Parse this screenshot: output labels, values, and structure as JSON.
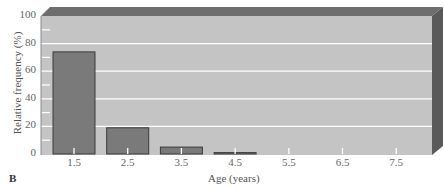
{
  "chart_data": {
    "type": "bar",
    "title": "",
    "panel_label": "B",
    "xlabel": "Age (years)",
    "ylabel": "Relative frequency (%)",
    "categories": [
      "1.5",
      "2.5",
      "3.5",
      "4.5",
      "5.5",
      "6.5",
      "7.5"
    ],
    "values": [
      74,
      19,
      5,
      1,
      0,
      0,
      0
    ],
    "ylim": [
      0,
      100
    ],
    "yticks": [
      0,
      20,
      40,
      60,
      80,
      100
    ],
    "grid": true,
    "legend": null,
    "style": "3D box background"
  },
  "colors": {
    "plot_bg": "#c4c4c4",
    "bar_fill": "#7a7a7a",
    "bar_edge": "#3a3a3a",
    "grid": "#ffffff",
    "bevel_top": "#6e6e6e",
    "bevel_side": "#5a5a5a"
  }
}
